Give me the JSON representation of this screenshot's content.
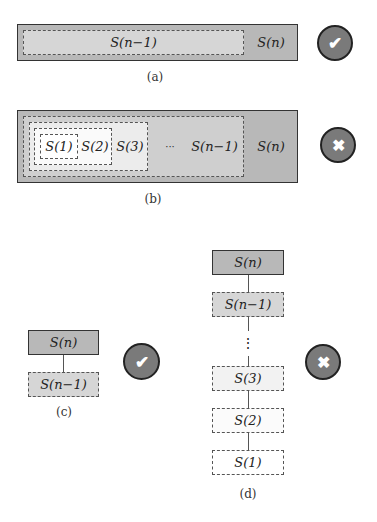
{
  "colors": {
    "outer_fill": "#b8b8b8",
    "level1_fill": "#cfcfcf",
    "level2_fill": "#e6e6e6",
    "level3_fill": "#f5f5f5",
    "level4_fill": "#ffffff",
    "icon_fill": "#7a7a7a",
    "icon_border": "#222222"
  },
  "panel_a": {
    "caption": "(a)",
    "outer_label": "S(n)",
    "inner_label": "S(n−1)",
    "status_icon": "check",
    "status_glyph": "✔"
  },
  "panel_b": {
    "caption": "(b)",
    "labels": [
      "S(1)",
      "S(2)",
      "S(3)",
      "···",
      "S(n−1)",
      "S(n)"
    ],
    "status_icon": "cross",
    "status_glyph": "✖"
  },
  "panel_c": {
    "caption": "(c)",
    "nodes": [
      "S(n)",
      "S(n−1)"
    ],
    "status_icon": "check",
    "status_glyph": "✔"
  },
  "panel_d": {
    "caption": "(d)",
    "nodes": [
      "S(n)",
      "S(n−1)",
      "S(3)",
      "S(2)",
      "S(1)"
    ],
    "ellipsis": "⋮",
    "status_icon": "cross",
    "status_glyph": "✖"
  }
}
